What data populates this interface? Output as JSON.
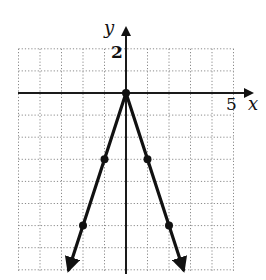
{
  "chart_data": {
    "type": "line",
    "title": "",
    "function": "y = -3|x|",
    "xlabel": "x",
    "ylabel": "y",
    "xlim": [
      -5,
      5
    ],
    "ylim": [
      -8,
      2
    ],
    "grid": true,
    "grid_spacing": 1,
    "tick_labels": {
      "x": [
        {
          "value": 5,
          "label": "5"
        }
      ],
      "y": [
        {
          "value": 2,
          "label": "2"
        }
      ]
    },
    "series": [
      {
        "name": "y = -3|x|",
        "points": [
          {
            "x": -2.67,
            "y": -8,
            "marker": false,
            "arrow": true
          },
          {
            "x": -2,
            "y": -6,
            "marker": true
          },
          {
            "x": -1,
            "y": -3,
            "marker": true
          },
          {
            "x": 0,
            "y": 0,
            "marker": true
          },
          {
            "x": 1,
            "y": -3,
            "marker": true
          },
          {
            "x": 2,
            "y": -6,
            "marker": true
          },
          {
            "x": 2.67,
            "y": -8,
            "marker": false,
            "arrow": true
          }
        ]
      }
    ],
    "legend": null
  },
  "labels": {
    "x_axis": "x",
    "y_axis": "y",
    "x_tick": "5",
    "y_tick": "2"
  }
}
